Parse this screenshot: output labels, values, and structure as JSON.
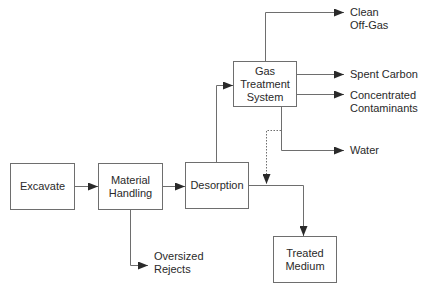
{
  "diagram": {
    "type": "process-flow",
    "boxes": {
      "excavate": "Excavate",
      "material_handling": "Material\nHandling",
      "desorption": "Desorption",
      "gas_treatment": "Gas\nTreatment\nSystem",
      "treated_medium": "Treated\nMedium"
    },
    "outputs": {
      "clean_off_gas": "Clean\nOff-Gas",
      "spent_carbon": "Spent Carbon",
      "concentrated_contaminants": "Concentrated\nContaminants",
      "water": "Water",
      "oversized_rejects": "Oversized\nRejects"
    },
    "edges": [
      {
        "from": "Excavate",
        "to": "Material Handling",
        "style": "solid"
      },
      {
        "from": "Material Handling",
        "to": "Desorption",
        "style": "solid"
      },
      {
        "from": "Material Handling",
        "to": "Oversized Rejects",
        "style": "solid"
      },
      {
        "from": "Desorption",
        "to": "Gas Treatment System",
        "style": "solid"
      },
      {
        "from": "Desorption",
        "to": "Treated Medium",
        "style": "solid"
      },
      {
        "from": "Gas Treatment System",
        "to": "Clean Off-Gas",
        "style": "solid"
      },
      {
        "from": "Gas Treatment System",
        "to": "Spent Carbon",
        "style": "solid"
      },
      {
        "from": "Gas Treatment System",
        "to": "Concentrated Contaminants",
        "style": "solid"
      },
      {
        "from": "Gas Treatment System",
        "to": "Water",
        "style": "solid"
      },
      {
        "from": "Gas Treatment System",
        "to": "Treated Medium",
        "style": "dotted"
      }
    ],
    "colors": {
      "line": "#6e6e6e",
      "text": "#2a2a2a",
      "background": "#ffffff"
    }
  }
}
